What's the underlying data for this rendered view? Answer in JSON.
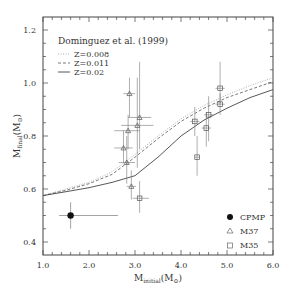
{
  "chart_data": {
    "type": "scatter",
    "title": "",
    "xlabel": "M_initial(M_sun)",
    "ylabel": "M_final(M_sun)",
    "xlabel_main": "M",
    "xlabel_sub": "initial",
    "xlabel_unit": "(M",
    "xlabel_unit_sub": "⊙",
    "xlabel_close": ")",
    "ylabel_main": "M",
    "ylabel_sub": "final",
    "ylabel_unit": "(M",
    "ylabel_unit_sub": "⊙",
    "ylabel_close": ")",
    "xlim": [
      1.0,
      6.0
    ],
    "ylim": [
      0.35,
      1.25
    ],
    "xticks": [
      "1.0",
      "2.0",
      "3.0",
      "4.0",
      "5.0",
      "6.0"
    ],
    "yticks": [
      "0.4",
      "0.6",
      "0.8",
      "1.0",
      "1.2"
    ],
    "grid": false,
    "model_legend": {
      "title": "Dominguez et al. (1999)",
      "entries": [
        "Z=0.008",
        "Z=0.011",
        "Z=0.02"
      ],
      "position": "upper-left"
    },
    "data_legend": {
      "entries": [
        "CPMP",
        "M37",
        "M35"
      ],
      "position": "lower-right"
    },
    "series": [
      {
        "name": "Z=0.008",
        "style": "dotted",
        "x": [
          1.0,
          1.5,
          2.0,
          2.5,
          3.0,
          3.5,
          4.0,
          4.5,
          5.0,
          5.5,
          6.0
        ],
        "y": [
          0.575,
          0.6,
          0.625,
          0.665,
          0.73,
          0.8,
          0.865,
          0.915,
          0.955,
          0.99,
          1.02
        ]
      },
      {
        "name": "Z=0.011",
        "style": "dashed",
        "x": [
          1.0,
          1.5,
          2.0,
          2.5,
          3.0,
          3.5,
          4.0,
          4.5,
          5.0,
          5.5,
          6.0
        ],
        "y": [
          0.575,
          0.595,
          0.62,
          0.655,
          0.72,
          0.79,
          0.855,
          0.905,
          0.945,
          0.975,
          1.005
        ]
      },
      {
        "name": "Z=0.02",
        "style": "solid",
        "x": [
          1.0,
          1.5,
          2.0,
          2.5,
          3.0,
          3.5,
          4.0,
          4.5,
          5.0,
          5.5,
          6.0
        ],
        "y": [
          0.575,
          0.59,
          0.605,
          0.625,
          0.65,
          0.72,
          0.8,
          0.86,
          0.905,
          0.945,
          0.975
        ]
      }
    ],
    "points": [
      {
        "cluster": "CPMP",
        "marker": "filled-circle",
        "x": 1.6,
        "y": 0.5,
        "xerr": [
          1.35,
          2.63
        ],
        "yerr": [
          0.45,
          0.55
        ]
      },
      {
        "cluster": "M37",
        "marker": "triangle",
        "x": 2.75,
        "y": 0.755,
        "xerr": [
          2.55,
          2.95
        ],
        "yerr": [
          0.7,
          0.82
        ]
      },
      {
        "cluster": "M37",
        "marker": "triangle",
        "x": 2.82,
        "y": 0.7,
        "xerr": [
          2.65,
          3.0
        ],
        "yerr": [
          0.62,
          0.8
        ]
      },
      {
        "cluster": "M37",
        "marker": "triangle",
        "x": 2.88,
        "y": 0.96,
        "xerr": [
          2.75,
          3.0
        ],
        "yerr": [
          0.87,
          1.02
        ]
      },
      {
        "cluster": "M37",
        "marker": "triangle",
        "x": 2.85,
        "y": 0.82,
        "xerr": [
          2.55,
          3.1
        ],
        "yerr": [
          0.75,
          0.88
        ]
      },
      {
        "cluster": "M37",
        "marker": "triangle",
        "x": 3.1,
        "y": 0.87,
        "xerr": [
          2.85,
          3.35
        ],
        "yerr": [
          0.75,
          1.08
        ]
      },
      {
        "cluster": "M37",
        "marker": "triangle",
        "x": 3.05,
        "y": 0.84,
        "xerr": [
          2.7,
          3.4
        ],
        "yerr": [
          0.68,
          1.02
        ]
      },
      {
        "cluster": "M37",
        "marker": "triangle",
        "x": 2.92,
        "y": 0.61,
        "xerr": [
          2.82,
          3.02
        ],
        "yerr": [
          0.56,
          0.67
        ]
      },
      {
        "cluster": "M35",
        "marker": "square",
        "x": 3.1,
        "y": 0.565,
        "xerr": [
          2.95,
          3.3
        ],
        "yerr": [
          0.51,
          0.63
        ]
      },
      {
        "cluster": "M35",
        "marker": "square",
        "x": 4.35,
        "y": 0.72,
        "xerr": [
          4.3,
          4.4
        ],
        "yerr": [
          0.65,
          0.8
        ]
      },
      {
        "cluster": "M35",
        "marker": "square",
        "x": 4.3,
        "y": 0.855,
        "xerr": [
          4.2,
          4.4
        ],
        "yerr": [
          0.8,
          0.91
        ]
      },
      {
        "cluster": "M35",
        "marker": "square",
        "x": 4.6,
        "y": 0.88,
        "xerr": [
          4.5,
          4.7
        ],
        "yerr": [
          0.78,
          0.95
        ]
      },
      {
        "cluster": "M35",
        "marker": "square",
        "x": 4.55,
        "y": 0.83,
        "xerr": [
          4.45,
          4.65
        ],
        "yerr": [
          0.76,
          0.89
        ]
      },
      {
        "cluster": "M35",
        "marker": "square",
        "x": 4.85,
        "y": 0.98,
        "xerr": [
          4.75,
          4.95
        ],
        "yerr": [
          0.92,
          1.08
        ]
      },
      {
        "cluster": "M35",
        "marker": "square",
        "x": 4.85,
        "y": 0.92,
        "xerr": [
          4.75,
          4.95
        ],
        "yerr": [
          0.88,
          0.96
        ]
      }
    ]
  }
}
